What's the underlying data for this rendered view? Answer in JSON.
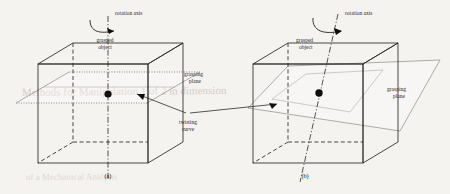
{
  "figure": {
    "caption_a": "(a)",
    "caption_b": "(b)",
    "background_color": "#f4f3f0",
    "ink_color": "#2b2724"
  },
  "panel_a": {
    "id": "(a)",
    "rotation_axis_label": "rotation axis",
    "grasped_object_label_line1": "grasped",
    "grasped_object_label_line2": "object",
    "grasping_plane_label_line1": "grasping",
    "grasping_plane_label_line2": "plane",
    "axis_orientation": "vertical",
    "plane_orientation": "horizontal"
  },
  "panel_b": {
    "id": "(b)",
    "rotation_axis_label": "rotation axis",
    "grasped_object_label_line1": "grasped",
    "grasped_object_label_line2": "object",
    "grasping_plane_label_line1": "grasping",
    "grasping_plane_label_line2": "plane",
    "axis_orientation": "tilted",
    "plane_orientation": "tilted"
  },
  "shared": {
    "twisting_curve_label_line1": "twisting",
    "twisting_curve_label_line2": "curve"
  },
  "bleed_through": {
    "line1": "Methods for Manipulation 1 of 2 in dimension",
    "line2": "of a Mechanical Analysis"
  }
}
